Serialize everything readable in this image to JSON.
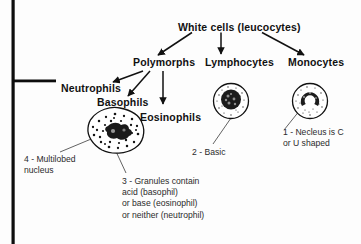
{
  "diagram": {
    "title": "White cells (leucocytes)",
    "taxonomy": [
      {
        "id": "polymorphs",
        "label": "Polymorphs"
      },
      {
        "id": "lymphocytes",
        "label": "Lymphocytes"
      },
      {
        "id": "monocytes",
        "label": "Monocytes"
      },
      {
        "id": "neutrophils",
        "label": "Neutrophils"
      },
      {
        "id": "basophils",
        "label": "Basophils"
      },
      {
        "id": "eosinophils",
        "label": "Eosinophils"
      }
    ],
    "annotations": [
      {
        "id": "note-1",
        "text": "1 - Necleus is C\nor U shaped"
      },
      {
        "id": "note-2",
        "text": "2 - Basic"
      },
      {
        "id": "note-3",
        "text": "3 - Granules contain\nacid (basophil)\nor base (eosinophil)\nor neither (neutrophil)"
      },
      {
        "id": "note-4",
        "text": "4 - Multilobed\nnucleus"
      }
    ],
    "cells": [
      {
        "id": "polymorph-cell",
        "name": "polymorph-cell-illustration"
      },
      {
        "id": "lymphocyte-cell",
        "name": "lymphocyte-cell-illustration"
      },
      {
        "id": "monocyte-cell",
        "name": "monocyte-cell-illustration"
      }
    ],
    "colors": {
      "ink": "#111111",
      "anno_ink": "#2b2b2b",
      "background": "#fdfdfd",
      "rule": "#0d0d0d"
    }
  }
}
